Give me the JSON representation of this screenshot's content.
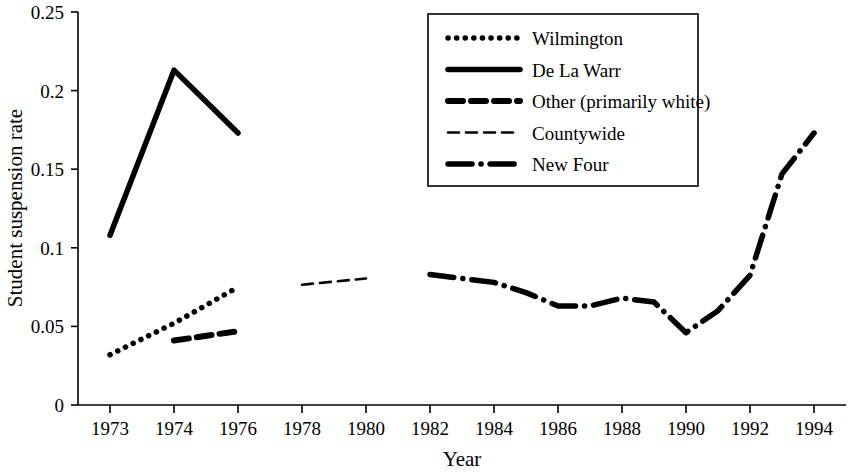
{
  "chart_data": {
    "type": "line",
    "title": "",
    "xlabel": "Year",
    "ylabel": "Student suspension rate",
    "categories": [
      1973,
      1974,
      1976,
      1978,
      1980,
      1982,
      1984,
      1986,
      1988,
      1990,
      1992,
      1994
    ],
    "x_tick_labels": [
      "1973",
      "1974",
      "1976",
      "1978",
      "1980",
      "1982",
      "1984",
      "1986",
      "1988",
      "1990",
      "1992",
      "1994"
    ],
    "y_tick_labels": [
      "0",
      "0.05",
      "0.1",
      "0.15",
      "0.2",
      "0.25"
    ],
    "y_ticks": [
      0,
      0.05,
      0.1,
      0.15,
      0.2,
      0.25
    ],
    "ylim": [
      0,
      0.25
    ],
    "grid": false,
    "legend_position": "top-center-right",
    "series": [
      {
        "name": "Wilmington",
        "style": "dotted",
        "x": [
          1973,
          1974,
          1976
        ],
        "values": [
          0.032,
          0.052,
          0.075
        ]
      },
      {
        "name": "De La Warr",
        "style": "solid",
        "x": [
          1973,
          1974,
          1976
        ],
        "values": [
          0.108,
          0.213,
          0.173
        ]
      },
      {
        "name": "Other (primarily white)",
        "style": "thick-dashed",
        "x": [
          1974,
          1976
        ],
        "values": [
          0.041,
          0.047
        ]
      },
      {
        "name": "Countywide",
        "style": "thin-dashed",
        "x": [
          1978,
          1980
        ],
        "values": [
          0.0765,
          0.0805
        ]
      },
      {
        "name": "New Four",
        "style": "dash-dot",
        "x": [
          1982,
          1983,
          1984,
          1985,
          1986,
          1987,
          1988,
          1989,
          1990,
          1991,
          1992,
          1993,
          1994
        ],
        "values": [
          0.083,
          0.0805,
          0.078,
          0.0715,
          0.063,
          0.063,
          0.068,
          0.0655,
          0.046,
          0.06,
          0.0825,
          0.147,
          0.173
        ]
      }
    ]
  },
  "legend": {
    "items": [
      {
        "label": "Wilmington",
        "swatch": "dotted-line-swatch"
      },
      {
        "label": "De La Warr",
        "swatch": "solid-line-swatch"
      },
      {
        "label": "Other (primarily white)",
        "swatch": "thick-dashed-line-swatch"
      },
      {
        "label": "Countywide",
        "swatch": "thin-dashed-line-swatch"
      },
      {
        "label": "New Four",
        "swatch": "dash-dot-line-swatch"
      }
    ]
  },
  "axes": {
    "x_title": "Year",
    "y_title": "Student suspension rate"
  }
}
